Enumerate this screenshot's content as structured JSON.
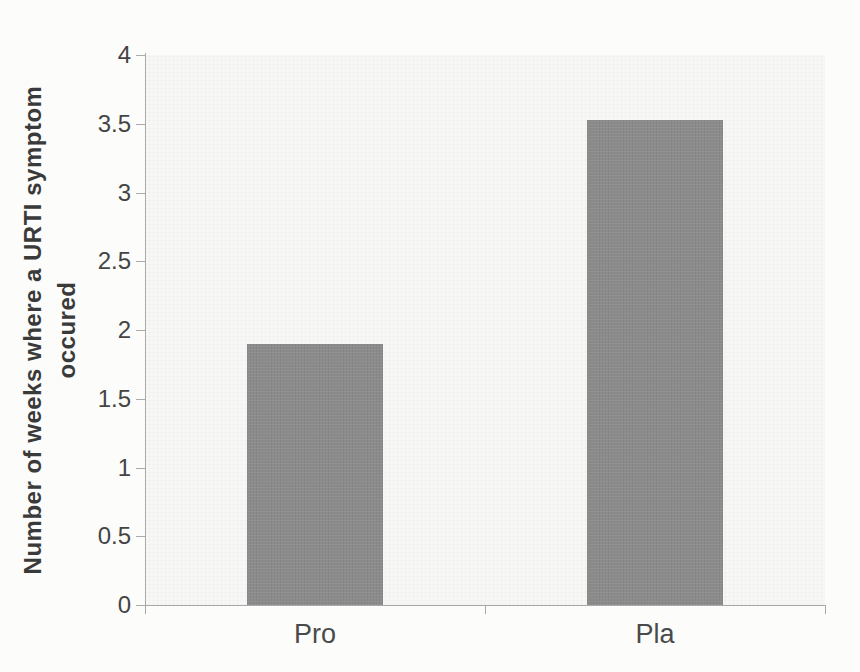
{
  "figure": {
    "page_background": "#fcfcfb"
  },
  "chart_data": {
    "type": "bar",
    "title": "",
    "categories": [
      "Pro",
      "Pla"
    ],
    "values": [
      1.9,
      3.53
    ],
    "ylabel": "Number of weeks where a URTI symptom occured",
    "ylabel_lines": [
      "Number of weeks where a URTI symptom",
      "occured"
    ],
    "xlabel": "",
    "ylim": [
      0,
      4
    ],
    "ytick_step": 0.5,
    "yticks": [
      0,
      0.5,
      1,
      1.5,
      2,
      2.5,
      3,
      3.5,
      4
    ],
    "ytick_labels": [
      "0",
      "0.5",
      "1",
      "1.5",
      "2",
      "2.5",
      "3",
      "3.5",
      "4"
    ],
    "grid": false,
    "legend": "none",
    "colors": {
      "bar_fill": "#8b8b8b",
      "axis": "#a9a9a9",
      "tick_text": "#444444",
      "category_text": "#4a4a4a",
      "ylabel_text": "#3a3a3a",
      "plot_background": "#f7f7f5",
      "page_background": "#fcfcfb"
    }
  }
}
